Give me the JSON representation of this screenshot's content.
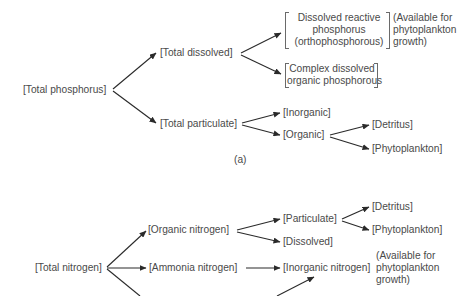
{
  "diagram_a": {
    "caption": "(a)",
    "root": "[Total phosphorus]",
    "total_dissolved": "[Total dissolved]",
    "total_particulate": "[Total particulate]",
    "dissolved_reactive": {
      "lines": [
        "Dissolved reactive",
        "phosphorus",
        "(orthophosphorous)"
      ]
    },
    "complex_dissolved": {
      "lines": [
        "Complex dissolved",
        "organic phosphorous"
      ]
    },
    "available_note": {
      "lines": [
        "(Available for",
        "phytoplankton",
        "growth)"
      ]
    },
    "inorganic": "[Inorganic]",
    "organic": "[Organic]",
    "detritus": "[Detritus]",
    "phytoplankton": "[Phytoplankton]"
  },
  "diagram_b": {
    "root": "[Total nitrogen]",
    "organic_nitrogen": "[Organic nitrogen]",
    "ammonia_nitrogen": "[Ammonia nitrogen]",
    "particulate": "[Particulate]",
    "dissolved": "[Dissolved]",
    "detritus": "[Detritus]",
    "phytoplankton": "[Phytoplankton]",
    "inorganic_nitrogen": "[Inorganic nitrogen]",
    "available_note": {
      "lines": [
        "(Available for",
        "phytoplankton",
        "growth)"
      ]
    }
  }
}
